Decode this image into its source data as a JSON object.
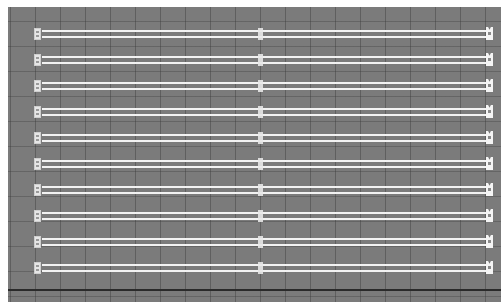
{
  "diagram": {
    "background_color": "#7b7b7b",
    "rail_color": "#f2f2f2",
    "grid_spacing_px": 25,
    "row_count": 10,
    "rows": [
      {
        "index": 1,
        "top": 22
      },
      {
        "index": 2,
        "top": 48
      },
      {
        "index": 3,
        "top": 74
      },
      {
        "index": 4,
        "top": 100
      },
      {
        "index": 5,
        "top": 126
      },
      {
        "index": 6,
        "top": 152
      },
      {
        "index": 7,
        "top": 178
      },
      {
        "index": 8,
        "top": 204
      },
      {
        "index": 9,
        "top": 230
      },
      {
        "index": 10,
        "top": 256
      }
    ],
    "baseline_top": 282
  }
}
